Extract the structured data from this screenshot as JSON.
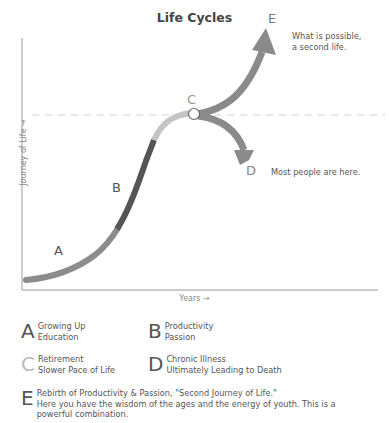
{
  "title": "Life Cycles",
  "axes": {
    "y_label": "Journey of Life →",
    "x_label": "Years →"
  },
  "points": {
    "A": {
      "letter": "A",
      "color": "#8a8a8a"
    },
    "B": {
      "letter": "B",
      "color": "#555555"
    },
    "C": {
      "letter": "C",
      "color": "#bdbdbd"
    },
    "D": {
      "letter": "D",
      "color": "#8a8a8a"
    },
    "E": {
      "letter": "E",
      "color": "#8a8a8a"
    }
  },
  "annotations": {
    "e_note_line1": "What is possible,",
    "e_note_line2": "a second life.",
    "d_note": "Most people are here."
  },
  "legend": [
    {
      "letter": "A",
      "line1": "Growing Up",
      "line2": "Education"
    },
    {
      "letter": "B",
      "line1": "Productivity",
      "line2": "Passion"
    },
    {
      "letter": "C",
      "line1": "Retirement",
      "line2": "Slower Pace of Life"
    },
    {
      "letter": "D",
      "line1": "Chronic Illness",
      "line2": "Ultimately Leading to Death"
    },
    {
      "letter": "E",
      "line1": "Rebirth of Productivity & Passion, \"Second Journey of Life.\"",
      "line2": "Here you have the wisdom of the ages and the energy of youth. This is a",
      "line3": "powerful combination."
    }
  ],
  "colors": {
    "axis": "#999999",
    "dashed": "#dddddd",
    "seg_a": "#8c8c8c",
    "seg_b": "#555555",
    "seg_c": "#c4c4c4",
    "branch": "#8a8a8a"
  }
}
